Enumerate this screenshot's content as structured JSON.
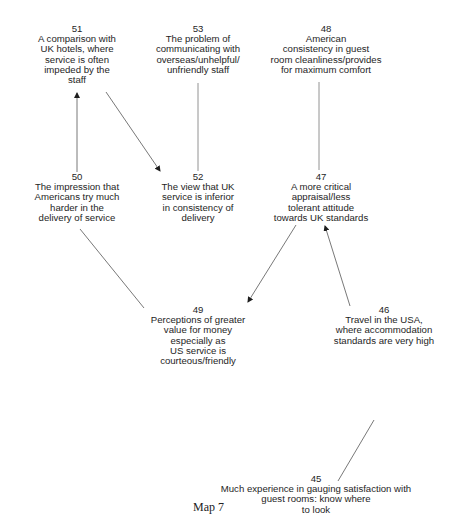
{
  "caption": "Map 7",
  "nodes": [
    {
      "id": "51",
      "text": "A comparison with\nUK hotels, where\nservice is often\nimpeded by the\nstaff"
    },
    {
      "id": "53",
      "text": "The problem of\ncommunicating with\noverseas/unhelpful/\nunfriendly staff"
    },
    {
      "id": "48",
      "text": "American\nconsistency in guest\nroom cleanliness/provides\nfor maximum comfort"
    },
    {
      "id": "50",
      "text": "The impression that\nAmericans try much\nharder in the\ndelivery of service"
    },
    {
      "id": "52",
      "text": "The view that UK\nservice is inferior\nin consistency of\ndelivery"
    },
    {
      "id": "47",
      "text": "A more critical\nappraisal/less\ntolerant attitude\ntowards UK standards"
    },
    {
      "id": "49",
      "text": "Perceptions of greater\nvalue for money\nespecially as\nUS service is\ncourteous/friendly"
    },
    {
      "id": "46",
      "text": "Travel in the USA,\nwhere accommodation\nstandards are very high"
    },
    {
      "id": "45",
      "text": "Much experience in gauging satisfaction with\nguest rooms: know where\nto look"
    }
  ],
  "links": [
    {
      "from": "50",
      "to": "51",
      "arrow": true
    },
    {
      "from": "51",
      "to": "52",
      "arrow": true
    },
    {
      "from": "53",
      "to": "52",
      "arrow": false
    },
    {
      "from": "48",
      "to": "47",
      "arrow": false
    },
    {
      "from": "50",
      "to": "49",
      "arrow": false
    },
    {
      "from": "47",
      "to": "49",
      "arrow": true
    },
    {
      "from": "46",
      "to": "47",
      "arrow": true
    },
    {
      "from": "45",
      "to": "46",
      "arrow": false
    }
  ]
}
